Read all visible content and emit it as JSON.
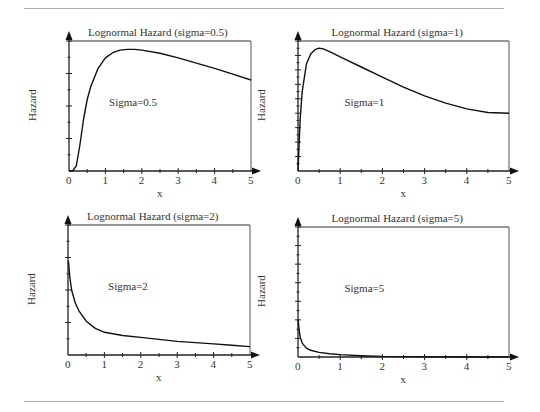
{
  "chart_data": [
    {
      "type": "line",
      "title": "Lognormal Hazard (sigma=0.5)",
      "xlabel": "x",
      "ylabel": "Hazard",
      "annotation": "Sigma=0.5",
      "xlim": [
        0,
        5
      ],
      "ylim": [
        0,
        2
      ],
      "xticks": [
        "0",
        "1",
        "2",
        "3",
        "4",
        "5"
      ],
      "yticks": [
        "0",
        "0.5",
        "1",
        "1.5",
        "2"
      ],
      "grid": false,
      "series": [
        {
          "name": "Sigma=0.5",
          "x": [
            0,
            0.1,
            0.2,
            0.3,
            0.4,
            0.5,
            0.6,
            0.8,
            1.0,
            1.2,
            1.4,
            1.6,
            1.8,
            2.0,
            2.5,
            3.0,
            3.5,
            4.0,
            4.5,
            5.0
          ],
          "y": [
            0,
            0.0,
            0.08,
            0.4,
            0.8,
            1.1,
            1.3,
            1.58,
            1.74,
            1.82,
            1.86,
            1.87,
            1.87,
            1.86,
            1.81,
            1.74,
            1.66,
            1.58,
            1.49,
            1.4
          ]
        }
      ]
    },
    {
      "type": "line",
      "title": "Lognormal Hazard (sigma=1)",
      "xlabel": "x",
      "ylabel": "Hazard",
      "annotation": "Sigma=1",
      "xlim": [
        0,
        5
      ],
      "ylim": [
        0,
        0.9
      ],
      "xticks": [
        "0",
        "1",
        "2",
        "3",
        "4",
        "5"
      ],
      "yticks": [
        "0",
        "0.1",
        "0.2",
        "0.3",
        "0.4",
        "0.5",
        "0.6",
        "0.7",
        "0.8",
        "0.9"
      ],
      "grid": false,
      "series": [
        {
          "name": "Sigma=1",
          "x": [
            0,
            0.05,
            0.1,
            0.2,
            0.3,
            0.4,
            0.5,
            0.6,
            0.8,
            1.0,
            1.5,
            2.0,
            2.5,
            3.0,
            3.5,
            4.0,
            4.5,
            5.0
          ],
          "y": [
            0,
            0.35,
            0.55,
            0.74,
            0.81,
            0.84,
            0.85,
            0.845,
            0.82,
            0.79,
            0.72,
            0.65,
            0.58,
            0.52,
            0.47,
            0.43,
            0.405,
            0.4
          ]
        }
      ]
    },
    {
      "type": "line",
      "title": "Lognormal Hazard (sigma=2)",
      "xlabel": "x",
      "ylabel": "Hazard",
      "annotation": "Sigma=2",
      "xlim": [
        0,
        5
      ],
      "ylim": [
        0,
        2
      ],
      "xticks": [
        "0",
        "1",
        "2",
        "3",
        "4",
        "5"
      ],
      "yticks": [
        "0",
        "0.5",
        "1",
        "1.5",
        "2"
      ],
      "grid": false,
      "series": [
        {
          "name": "Sigma=2",
          "x": [
            0.01,
            0.05,
            0.1,
            0.2,
            0.3,
            0.5,
            0.75,
            1.0,
            1.5,
            2.0,
            2.5,
            3.0,
            3.5,
            4.0,
            4.5,
            5.0
          ],
          "y": [
            1.45,
            1.2,
            1.0,
            0.8,
            0.68,
            0.52,
            0.41,
            0.35,
            0.3,
            0.27,
            0.24,
            0.21,
            0.19,
            0.17,
            0.15,
            0.13
          ]
        }
      ]
    },
    {
      "type": "line",
      "title": "Lognormal Hazard (sigma=5)",
      "xlabel": "x",
      "ylabel": "Hazard",
      "annotation": "Sigma=5",
      "xlim": [
        0,
        5
      ],
      "ylim": [
        0,
        7
      ],
      "xticks": [
        "0",
        "1",
        "2",
        "3",
        "4",
        "5"
      ],
      "yticks": [
        "0",
        "1",
        "2",
        "3",
        "4",
        "5",
        "6",
        "7"
      ],
      "grid": false,
      "series": [
        {
          "name": "Sigma=5",
          "x": [
            0.005,
            0.02,
            0.05,
            0.1,
            0.2,
            0.3,
            0.5,
            0.75,
            1.0,
            1.5,
            2.0,
            3.0,
            4.0,
            5.0
          ],
          "y": [
            2.0,
            1.6,
            1.1,
            0.75,
            0.48,
            0.36,
            0.25,
            0.18,
            0.13,
            0.07,
            0.03,
            0.01,
            0.0,
            0.0
          ]
        }
      ]
    }
  ]
}
